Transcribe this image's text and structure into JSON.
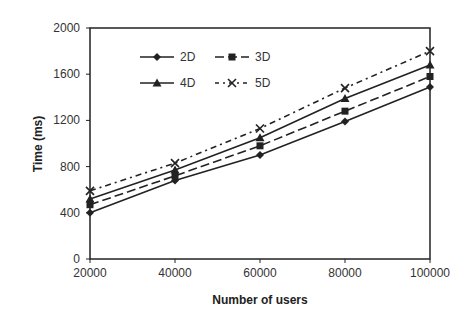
{
  "chart_data": {
    "type": "line",
    "title": "",
    "xlabel": "Number of users",
    "ylabel": "Time (ms)",
    "x": [
      20000,
      40000,
      60000,
      80000,
      100000
    ],
    "xticks": [
      "20000",
      "40000",
      "60000",
      "80000",
      "100000"
    ],
    "yticks": [
      "0",
      "400",
      "800",
      "1200",
      "1600",
      "2000"
    ],
    "xlim": [
      20000,
      100000
    ],
    "ylim": [
      0,
      2000
    ],
    "grid": false,
    "legend_position": "top-left",
    "series": [
      {
        "name": "2D",
        "marker": "diamond",
        "dash": "solid",
        "values": [
          400,
          680,
          900,
          1190,
          1490
        ]
      },
      {
        "name": "3D",
        "marker": "square",
        "dash": "dashed",
        "values": [
          470,
          720,
          980,
          1280,
          1580
        ]
      },
      {
        "name": "4D",
        "marker": "triangle",
        "dash": "solid",
        "values": [
          520,
          770,
          1050,
          1390,
          1680
        ]
      },
      {
        "name": "5D",
        "marker": "x",
        "dash": "dashdot",
        "values": [
          590,
          830,
          1130,
          1480,
          1800
        ]
      }
    ]
  }
}
